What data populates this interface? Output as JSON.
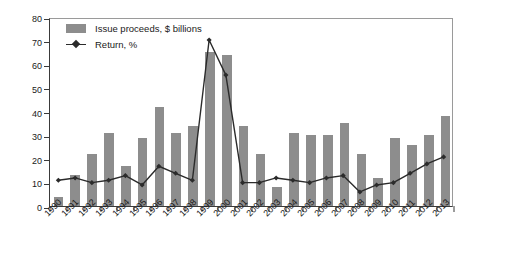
{
  "chart_data": {
    "type": "bar",
    "title": "",
    "subtitle": "",
    "xlabel": "",
    "ylabel": "",
    "ylim": [
      0,
      80
    ],
    "ystep": 10,
    "grid": false,
    "legend_position": "top-left",
    "categories": [
      "1990",
      "1991",
      "1992",
      "1993",
      "1994",
      "1995",
      "1996",
      "1997",
      "1998",
      "1999",
      "2000",
      "2001",
      "2002",
      "2003",
      "2004",
      "2005",
      "2006",
      "2007",
      "2008",
      "2009",
      "2010",
      "2011",
      "2012",
      "2013"
    ],
    "ytick_labels": [
      "0",
      "10",
      "20",
      "30",
      "40",
      "50",
      "60",
      "70",
      "80"
    ],
    "series": [
      {
        "name": "Issue proceeds, $ billions",
        "type": "bar",
        "color": "#8d8d8d",
        "values": [
          4,
          13,
          22,
          31,
          17,
          29,
          42,
          31,
          34,
          65,
          64,
          34,
          22,
          8,
          31,
          30,
          30,
          35,
          22,
          12,
          29,
          26,
          30,
          38
        ]
      },
      {
        "name": "Return, %",
        "type": "line",
        "color": "#2b2b2b",
        "values": [
          11,
          12,
          10,
          11,
          13,
          9,
          17,
          14,
          11,
          71,
          56,
          10,
          10,
          12,
          11,
          10,
          12,
          13,
          6,
          9,
          10,
          14,
          18,
          21
        ]
      }
    ]
  },
  "legend": {
    "items": [
      {
        "label": "Issue proceeds, $ billions",
        "marker": "bar-swatch"
      },
      {
        "label": "Return, %",
        "marker": "line-diamond-swatch"
      }
    ]
  }
}
